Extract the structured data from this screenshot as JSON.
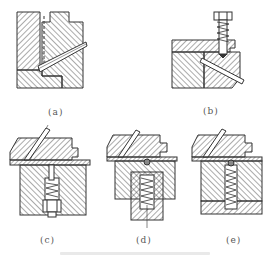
{
  "figure": {
    "type": "technical-section-drawings",
    "subfigures": [
      {
        "id": "a",
        "label": "(a)",
        "description": "block with inclined guide pin and stepped slider"
      },
      {
        "id": "b",
        "label": "(b)",
        "description": "slider with inclined pin locked by spring-loaded screw"
      },
      {
        "id": "c",
        "label": "(c)",
        "description": "slider with spring-loaded detent plunger, plug-screw retained"
      },
      {
        "id": "d",
        "label": "(d)",
        "description": "slider with ball detent and spring in external housing"
      },
      {
        "id": "e",
        "label": "(e)",
        "description": "slider with ball detent and spring in bored base block"
      }
    ],
    "colors": {
      "line": "#333333",
      "hatch": "#444444",
      "background": "#ffffff",
      "label": "#555555"
    },
    "caption_visible": false
  }
}
